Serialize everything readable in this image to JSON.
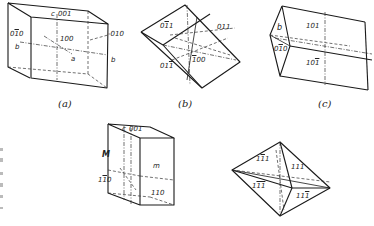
{
  "figure": {
    "panels": [
      {
        "id": "a",
        "caption": "(a)",
        "labels": {
          "c_axis": "c",
          "face_001": "001",
          "face_0-10": "010",
          "b_left": "b",
          "face_100": "100",
          "a_axis": "a",
          "face_010": "-010",
          "b_right": "b"
        }
      },
      {
        "id": "b",
        "caption": "(b)",
        "labels": {
          "face_0-11": "011",
          "face_011": "011",
          "face_01-1": "011",
          "face_-100": "100"
        }
      },
      {
        "id": "c",
        "caption": "(c)",
        "labels": {
          "b_face": "b",
          "face_0-10": "010",
          "face_101": "101",
          "face_10-1": "101"
        }
      },
      {
        "id": "d",
        "caption": "",
        "labels": {
          "c_axis": "c",
          "face_001": "001",
          "M_face": "M",
          "face_1-10": "110",
          "m_face": "m",
          "face_110": "110"
        }
      },
      {
        "id": "e",
        "caption": "",
        "labels": {
          "face_1-11": "111",
          "face_111": "111",
          "face_1-1-1": "111",
          "face_11-1": "111"
        }
      }
    ]
  }
}
